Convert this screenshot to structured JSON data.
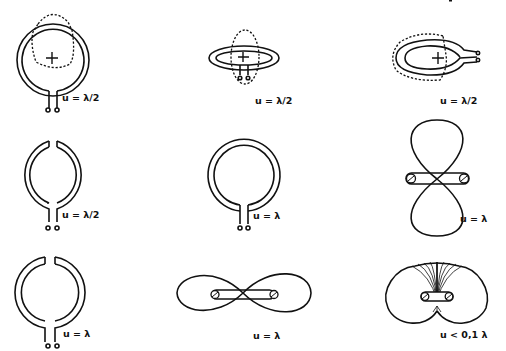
{
  "figure": {
    "panels": [
      {
        "id": "r1c1",
        "label": "u = λ/2",
        "description": "closed loop with feed, dashed radiation pattern inside"
      },
      {
        "id": "r1c2",
        "label": "u = λ/2",
        "description": "loop in perspective (top view), vertical dashed lobe"
      },
      {
        "id": "r1c3",
        "label": "u = λ/2",
        "description": "loop in perspective (side view), dashed lobe to the left"
      },
      {
        "id": "r2c1",
        "label": "u = λ/2",
        "description": "split loop with gap at top"
      },
      {
        "id": "r2c2",
        "label": "u = λ",
        "description": "closed loop with feed"
      },
      {
        "id": "r2c3",
        "label": "u = λ",
        "description": "vertical figure-eight pattern around loop"
      },
      {
        "id": "r3c1",
        "label": "u = λ",
        "description": "split loop with gap at top"
      },
      {
        "id": "r3c2",
        "label": "u = λ",
        "description": "horizontal figure-eight pattern around loop"
      },
      {
        "id": "r3c3",
        "label": "u < 0,1 λ",
        "description": "two overlapping circles with hatched region, small loop"
      }
    ]
  },
  "colors": {
    "ink": "#111111",
    "background": "#ffffff"
  }
}
